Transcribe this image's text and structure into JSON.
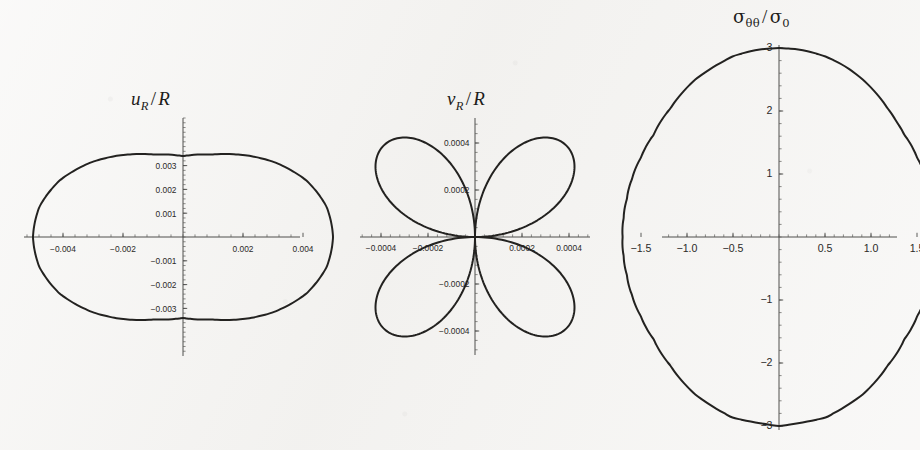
{
  "figure": {
    "background_color": "#f4f3f1",
    "curve_color": "#232220",
    "axis_color": "#3d3c3a",
    "panel_count": 3
  },
  "panels": [
    {
      "id": "u",
      "title_main": "u",
      "title_sub": "R",
      "title_slash": "/",
      "title_denom": "R",
      "title_plain": "u_R / R"
    },
    {
      "id": "v",
      "title_main": "v",
      "title_sub": "R",
      "title_slash": "/",
      "title_denom": "R",
      "title_plain": "v_R / R"
    },
    {
      "id": "s",
      "title_main": "σ",
      "title_sub": "θθ",
      "title_slash": "/",
      "title_denom": "σ",
      "title_denom_sub": "0",
      "title_plain": "sigma_thetatheta / sigma_0"
    }
  ],
  "chart_data": [
    {
      "type": "line",
      "plot_style": "polar-parametric",
      "title": "u_R / R",
      "xlabel": "",
      "ylabel": "",
      "description": "Closed rounded-oval (superellipse-like) polar curve of normalized radial displacement u_R/R plotted in the plane; wider horizontally than vertically.",
      "xlim": [
        -0.0052,
        0.0052
      ],
      "ylim": [
        -0.0037,
        0.0037
      ],
      "xticks": [
        -0.004,
        -0.002,
        0.002,
        0.004
      ],
      "xtick_labels": [
        "-0.004",
        "-0.002",
        "0.002",
        "0.004"
      ],
      "yticks": [
        -0.003,
        -0.002,
        -0.001,
        0.001,
        0.002,
        0.003
      ],
      "ytick_labels": [
        "-0.003",
        "-0.002",
        "-0.001",
        "0.001",
        "0.002",
        "0.003"
      ],
      "grid": false,
      "legend": "none",
      "extremes": {
        "x_max": 0.005,
        "x_min": -0.005,
        "y_max": 0.0034,
        "y_min": -0.0034
      },
      "curve_points_polar": [
        {
          "theta_deg": 0,
          "r": 0.005
        },
        {
          "theta_deg": 15,
          "r": 0.00495
        },
        {
          "theta_deg": 30,
          "r": 0.00475
        },
        {
          "theta_deg": 45,
          "r": 0.0044
        },
        {
          "theta_deg": 60,
          "r": 0.00398
        },
        {
          "theta_deg": 75,
          "r": 0.00358
        },
        {
          "theta_deg": 90,
          "r": 0.0034
        },
        {
          "theta_deg": 105,
          "r": 0.00358
        },
        {
          "theta_deg": 120,
          "r": 0.00398
        },
        {
          "theta_deg": 135,
          "r": 0.0044
        },
        {
          "theta_deg": 150,
          "r": 0.00475
        },
        {
          "theta_deg": 165,
          "r": 0.00495
        },
        {
          "theta_deg": 180,
          "r": 0.005
        },
        {
          "theta_deg": 195,
          "r": 0.00495
        },
        {
          "theta_deg": 210,
          "r": 0.00475
        },
        {
          "theta_deg": 225,
          "r": 0.0044
        },
        {
          "theta_deg": 240,
          "r": 0.00398
        },
        {
          "theta_deg": 255,
          "r": 0.00358
        },
        {
          "theta_deg": 270,
          "r": 0.0034
        },
        {
          "theta_deg": 285,
          "r": 0.00358
        },
        {
          "theta_deg": 300,
          "r": 0.00398
        },
        {
          "theta_deg": 315,
          "r": 0.0044
        },
        {
          "theta_deg": 330,
          "r": 0.00475
        },
        {
          "theta_deg": 345,
          "r": 0.00495
        }
      ]
    },
    {
      "type": "line",
      "plot_style": "polar-rose",
      "title": "v_R / R",
      "xlabel": "",
      "ylabel": "",
      "description": "Four-petal rose curve r = a*|sin(2*theta)| of normalized tangential displacement v_R/R; petals centred on the 45, 135, 225 and 315 degree diagonals.",
      "xlim": [
        -0.00058,
        0.00058
      ],
      "ylim": [
        -0.00058,
        0.00058
      ],
      "xticks": [
        -0.0004,
        -0.0002,
        0.0002,
        0.0004
      ],
      "xtick_labels": [
        "-0.0004",
        "-0.0002",
        "0.0002",
        "0.0004"
      ],
      "yticks": [
        -0.0004,
        -0.0002,
        0.0002,
        0.0004
      ],
      "ytick_labels": [
        "-0.0004",
        "-0.0002",
        "0.0002",
        "0.0004"
      ],
      "grid": false,
      "legend": "none",
      "rose": {
        "petal_count": 4,
        "amplitude": 0.00055,
        "petal_angles_deg": [
          45,
          135,
          225,
          315
        ],
        "formula": "r = 0.00055 * |sin(2*theta)|"
      }
    },
    {
      "type": "line",
      "plot_style": "polar-parametric",
      "title": "sigma_thetatheta / sigma_0",
      "xlabel": "",
      "ylabel": "",
      "description": "Closed stadium / rounded-rectangle polar curve of normalized hoop stress sigma_thetatheta/sigma_0; tall vertically with nearly straight vertical flanks.",
      "xlim": [
        -1.95,
        1.95
      ],
      "ylim": [
        -3.3,
        3.3
      ],
      "xticks": [
        -1.5,
        -1.0,
        -0.5,
        0.5,
        1.0,
        1.5
      ],
      "xtick_labels": [
        "-1.5",
        "-1.0",
        "-0.5",
        "0.5",
        "1.0",
        "1.5"
      ],
      "yticks": [
        -3,
        -2,
        -1,
        1,
        2,
        3
      ],
      "ytick_labels": [
        "-3",
        "-2",
        "-1",
        "1",
        "2",
        "3"
      ],
      "grid": false,
      "legend": "none",
      "extremes": {
        "x_max": 1.7,
        "x_min": -1.7,
        "y_max": 3.0,
        "y_min": -3.0
      },
      "curve_points_polar": [
        {
          "theta_deg": 0,
          "r": 1.7
        },
        {
          "theta_deg": 10,
          "r": 1.715
        },
        {
          "theta_deg": 20,
          "r": 1.76
        },
        {
          "theta_deg": 30,
          "r": 1.845
        },
        {
          "theta_deg": 40,
          "r": 1.96
        },
        {
          "theta_deg": 50,
          "r": 2.12
        },
        {
          "theta_deg": 55,
          "r": 2.23
        },
        {
          "theta_deg": 60,
          "r": 2.36
        },
        {
          "theta_deg": 65,
          "r": 2.51
        },
        {
          "theta_deg": 70,
          "r": 2.66
        },
        {
          "theta_deg": 75,
          "r": 2.8
        },
        {
          "theta_deg": 80,
          "r": 2.91
        },
        {
          "theta_deg": 85,
          "r": 2.98
        },
        {
          "theta_deg": 90,
          "r": 3.0
        },
        {
          "theta_deg": 95,
          "r": 2.98
        },
        {
          "theta_deg": 100,
          "r": 2.91
        },
        {
          "theta_deg": 110,
          "r": 2.66
        },
        {
          "theta_deg": 120,
          "r": 2.36
        },
        {
          "theta_deg": 130,
          "r": 2.12
        },
        {
          "theta_deg": 140,
          "r": 1.96
        },
        {
          "theta_deg": 150,
          "r": 1.845
        },
        {
          "theta_deg": 160,
          "r": 1.76
        },
        {
          "theta_deg": 170,
          "r": 1.715
        },
        {
          "theta_deg": 180,
          "r": 1.7
        },
        {
          "theta_deg": 190,
          "r": 1.715
        },
        {
          "theta_deg": 200,
          "r": 1.76
        },
        {
          "theta_deg": 210,
          "r": 1.845
        },
        {
          "theta_deg": 220,
          "r": 1.96
        },
        {
          "theta_deg": 230,
          "r": 2.12
        },
        {
          "theta_deg": 240,
          "r": 2.36
        },
        {
          "theta_deg": 250,
          "r": 2.66
        },
        {
          "theta_deg": 260,
          "r": 2.91
        },
        {
          "theta_deg": 270,
          "r": 3.0
        },
        {
          "theta_deg": 280,
          "r": 2.91
        },
        {
          "theta_deg": 290,
          "r": 2.66
        },
        {
          "theta_deg": 300,
          "r": 2.36
        },
        {
          "theta_deg": 310,
          "r": 2.12
        },
        {
          "theta_deg": 320,
          "r": 1.96
        },
        {
          "theta_deg": 330,
          "r": 1.845
        },
        {
          "theta_deg": 340,
          "r": 1.76
        },
        {
          "theta_deg": 350,
          "r": 1.715
        }
      ]
    }
  ]
}
